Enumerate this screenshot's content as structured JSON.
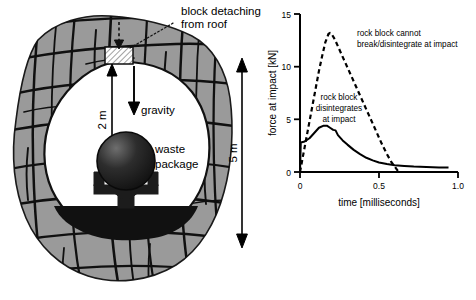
{
  "figure": {
    "left_panel": {
      "name": "tunnel-cross-section",
      "callout": {
        "line1": "block detaching",
        "line2": "from roof"
      },
      "labels": {
        "gravity": "gravity",
        "height_drop": "2 m",
        "tunnel_span": "5 m",
        "waste_line1": "waste",
        "waste_line2": "package"
      },
      "colors": {
        "rock_mass": "#9a9a9a",
        "joints": "#101010",
        "opening": "#ffffff",
        "waste_package_dark": "#131313",
        "waste_package_light": "#6e6e6e",
        "invert_fill": "#111111"
      }
    },
    "right_panel": {
      "name": "impact-force-chart",
      "chart_data": {
        "type": "line",
        "title": "",
        "xlabel": "time [milliseconds]",
        "ylabel": "force at impact [kN]",
        "xlim": [
          0,
          1.0
        ],
        "ylim": [
          0,
          15
        ],
        "xticks": [
          0,
          0.5,
          1.0
        ],
        "xticklabels": [
          "0",
          "0.5",
          "1.0"
        ],
        "yticks": [
          0,
          5,
          10,
          15
        ],
        "yticklabels": [
          "0",
          "5",
          "10",
          "15"
        ],
        "grid": false,
        "legend": "annotations",
        "series": [
          {
            "name": "rock block cannot break/disintegrate at impact",
            "style": "dashed",
            "color": "#000000",
            "points": [
              [
                0.0,
                0.0
              ],
              [
                0.02,
                1.6
              ],
              [
                0.04,
                3.2
              ],
              [
                0.06,
                4.8
              ],
              [
                0.08,
                6.4
              ],
              [
                0.1,
                8.0
              ],
              [
                0.12,
                9.6
              ],
              [
                0.14,
                11.0
              ],
              [
                0.16,
                12.3
              ],
              [
                0.18,
                13.1
              ],
              [
                0.19,
                13.2
              ],
              [
                0.2,
                13.1
              ],
              [
                0.22,
                12.6
              ],
              [
                0.25,
                11.6
              ],
              [
                0.28,
                10.6
              ],
              [
                0.31,
                9.6
              ],
              [
                0.34,
                8.6
              ],
              [
                0.37,
                7.6
              ],
              [
                0.4,
                6.6
              ],
              [
                0.43,
                5.6
              ],
              [
                0.46,
                4.6
              ],
              [
                0.49,
                3.6
              ],
              [
                0.52,
                2.6
              ],
              [
                0.55,
                1.7
              ],
              [
                0.58,
                0.9
              ],
              [
                0.61,
                0.3
              ],
              [
                0.625,
                0.0
              ]
            ]
          },
          {
            "name": "rock block disintegrates at impact",
            "style": "solid",
            "color": "#000000",
            "points": [
              [
                0.0,
                0.0
              ],
              [
                0.005,
                2.8
              ],
              [
                0.03,
                2.9
              ],
              [
                0.06,
                3.2
              ],
              [
                0.09,
                3.7
              ],
              [
                0.12,
                4.2
              ],
              [
                0.15,
                4.4
              ],
              [
                0.17,
                4.4
              ],
              [
                0.19,
                4.2
              ],
              [
                0.21,
                4.0
              ],
              [
                0.225,
                3.95
              ],
              [
                0.24,
                3.5
              ],
              [
                0.27,
                3.0
              ],
              [
                0.3,
                2.6
              ],
              [
                0.34,
                2.1
              ],
              [
                0.38,
                1.7
              ],
              [
                0.42,
                1.35
              ],
              [
                0.46,
                1.1
              ],
              [
                0.5,
                0.9
              ],
              [
                0.55,
                0.75
              ],
              [
                0.6,
                0.65
              ],
              [
                0.66,
                0.58
              ],
              [
                0.72,
                0.52
              ],
              [
                0.8,
                0.47
              ],
              [
                0.88,
                0.43
              ],
              [
                0.94,
                0.42
              ]
            ]
          }
        ],
        "annotations": [
          {
            "id": "annotation-cannot-break",
            "line1": "rock block cannot",
            "line2": "break/disintegrate at impact"
          },
          {
            "id": "annotation-disintegrates",
            "line1": "rock block",
            "line2": "disintegrates",
            "line3": "at impact"
          }
        ]
      }
    }
  }
}
